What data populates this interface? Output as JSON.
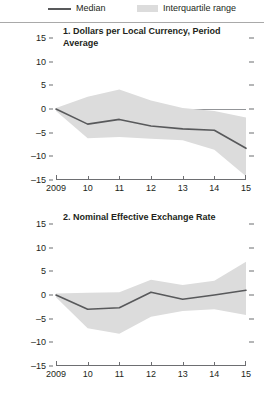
{
  "legend": {
    "items": [
      {
        "key": "median",
        "label": "Median",
        "color": "#58595b",
        "marker": "line"
      },
      {
        "key": "iqr",
        "label": "Interquartile range",
        "color": "#dcdcdc",
        "marker": "box"
      }
    ]
  },
  "axis": {
    "y_ticks": [
      "15",
      "10",
      "5",
      "0",
      "-5",
      "-10",
      "-15"
    ],
    "y_ticks_display": [
      "15",
      "10",
      "5",
      "0",
      "–5",
      "–10",
      "–15"
    ],
    "x_ticks": [
      "2009",
      "10",
      "11",
      "12",
      "13",
      "14",
      "15"
    ]
  },
  "chart_data": [
    {
      "type": "area",
      "panel": 1,
      "title": "1. Dollars per Local Currency, Period Average",
      "xlabel": "",
      "ylabel": "",
      "x": [
        2009,
        2010,
        2011,
        2012,
        2013,
        2014,
        2015
      ],
      "xtick_labels": [
        "2009",
        "10",
        "11",
        "12",
        "13",
        "14",
        "15"
      ],
      "ylim": [
        -15,
        15
      ],
      "xlim": [
        2009,
        2015
      ],
      "grid": false,
      "zero_line": true,
      "legend_position": "top",
      "series": [
        {
          "name": "Median",
          "type": "line",
          "color": "#58595b",
          "values": [
            0.0,
            -3.2,
            -2.2,
            -3.6,
            -4.2,
            -4.5,
            -8.3
          ]
        },
        {
          "name": "Interquartile range upper",
          "type": "band-upper",
          "color": "#dcdcdc",
          "values": [
            0.2,
            2.6,
            4.1,
            1.8,
            0.2,
            -0.4,
            -1.8
          ]
        },
        {
          "name": "Interquartile range lower",
          "type": "band-lower",
          "color": "#dcdcdc",
          "values": [
            -0.4,
            -6.2,
            -5.9,
            -6.3,
            -6.6,
            -8.6,
            -14.2
          ]
        }
      ]
    },
    {
      "type": "area",
      "panel": 2,
      "title": "2. Nominal Effective Exchange Rate",
      "xlabel": "",
      "ylabel": "",
      "x": [
        2009,
        2010,
        2011,
        2012,
        2013,
        2014,
        2015
      ],
      "xtick_labels": [
        "2009",
        "10",
        "11",
        "12",
        "13",
        "14",
        "15"
      ],
      "ylim": [
        -15,
        15
      ],
      "xlim": [
        2009,
        2015
      ],
      "grid": false,
      "zero_line": true,
      "legend_position": "top",
      "series": [
        {
          "name": "Median",
          "type": "line",
          "color": "#58595b",
          "values": [
            0.0,
            -3.0,
            -2.7,
            0.6,
            -0.9,
            0.0,
            1.0
          ]
        },
        {
          "name": "Interquartile range upper",
          "type": "band-upper",
          "color": "#dcdcdc",
          "values": [
            0.3,
            0.5,
            0.6,
            3.2,
            2.1,
            3.0,
            7.0
          ]
        },
        {
          "name": "Interquartile range lower",
          "type": "band-lower",
          "color": "#dcdcdc",
          "values": [
            -0.5,
            -7.0,
            -8.2,
            -4.6,
            -3.4,
            -3.0,
            -4.2
          ]
        }
      ]
    }
  ]
}
